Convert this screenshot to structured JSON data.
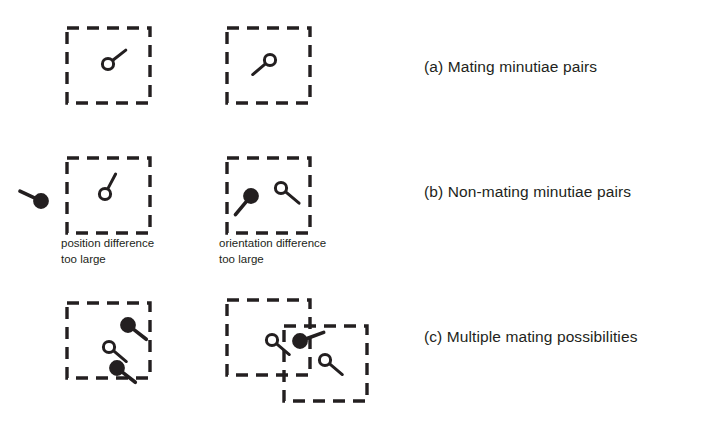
{
  "figure": {
    "background_color": "#ffffff",
    "ink_color": "#231f20",
    "rows": [
      {
        "id": "row-a",
        "caption": "(a) Mating minutiae pairs",
        "boxes": [
          {
            "id": "a-box-1",
            "x": 67,
            "y": 28,
            "w": 83,
            "h": 75
          },
          {
            "id": "a-box-2",
            "x": 227,
            "y": 28,
            "w": 83,
            "h": 75
          }
        ],
        "minutiae": [
          {
            "id": "a-m1",
            "cx": 108,
            "cy": 64,
            "filled": false,
            "angle_deg": -38,
            "tail": 17
          },
          {
            "id": "a-m2",
            "cx": 270,
            "cy": 60,
            "filled": false,
            "angle_deg": 140,
            "tail": 17
          }
        ]
      },
      {
        "id": "row-b",
        "caption": "(b) Non-mating minutiae pairs",
        "sub_captions": [
          "position difference\ntoo large",
          "orientation difference\ntoo large"
        ],
        "boxes": [
          {
            "id": "b-box-1",
            "x": 67,
            "y": 158,
            "w": 83,
            "h": 75
          },
          {
            "id": "b-box-2",
            "x": 227,
            "y": 158,
            "w": 83,
            "h": 75
          }
        ],
        "minutiae": [
          {
            "id": "b-m1",
            "cx": 41,
            "cy": 201,
            "filled": true,
            "angle_deg": 205,
            "tail": 17
          },
          {
            "id": "b-m2",
            "cx": 105,
            "cy": 194,
            "filled": false,
            "angle_deg": -62,
            "tail": 17
          },
          {
            "id": "b-m3",
            "cx": 251,
            "cy": 196,
            "filled": true,
            "angle_deg": 130,
            "tail": 18
          },
          {
            "id": "b-m4",
            "cx": 281,
            "cy": 188,
            "filled": false,
            "angle_deg": 40,
            "tail": 18
          }
        ]
      },
      {
        "id": "row-c",
        "caption": "(c) Multiple mating possibilities",
        "boxes": [
          {
            "id": "c-box-1",
            "x": 67,
            "y": 303,
            "w": 83,
            "h": 75
          },
          {
            "id": "c-box-2",
            "x": 227,
            "y": 300,
            "w": 83,
            "h": 75
          },
          {
            "id": "c-box-3",
            "x": 284,
            "y": 326,
            "w": 83,
            "h": 75
          }
        ],
        "minutiae": [
          {
            "id": "c-m1",
            "cx": 128,
            "cy": 325,
            "filled": true,
            "angle_deg": 38,
            "tail": 17
          },
          {
            "id": "c-m2",
            "cx": 109,
            "cy": 347,
            "filled": false,
            "angle_deg": 40,
            "tail": 17
          },
          {
            "id": "c-m3",
            "cx": 117,
            "cy": 368,
            "filled": true,
            "angle_deg": 38,
            "tail": 17
          },
          {
            "id": "c-m4",
            "cx": 272,
            "cy": 340,
            "filled": false,
            "angle_deg": 40,
            "tail": 17
          },
          {
            "id": "c-m5",
            "cx": 300,
            "cy": 341,
            "filled": true,
            "angle_deg": -20,
            "tail": 19
          },
          {
            "id": "c-m6",
            "cx": 325,
            "cy": 360,
            "filled": false,
            "angle_deg": 40,
            "tail": 17
          }
        ]
      }
    ]
  }
}
